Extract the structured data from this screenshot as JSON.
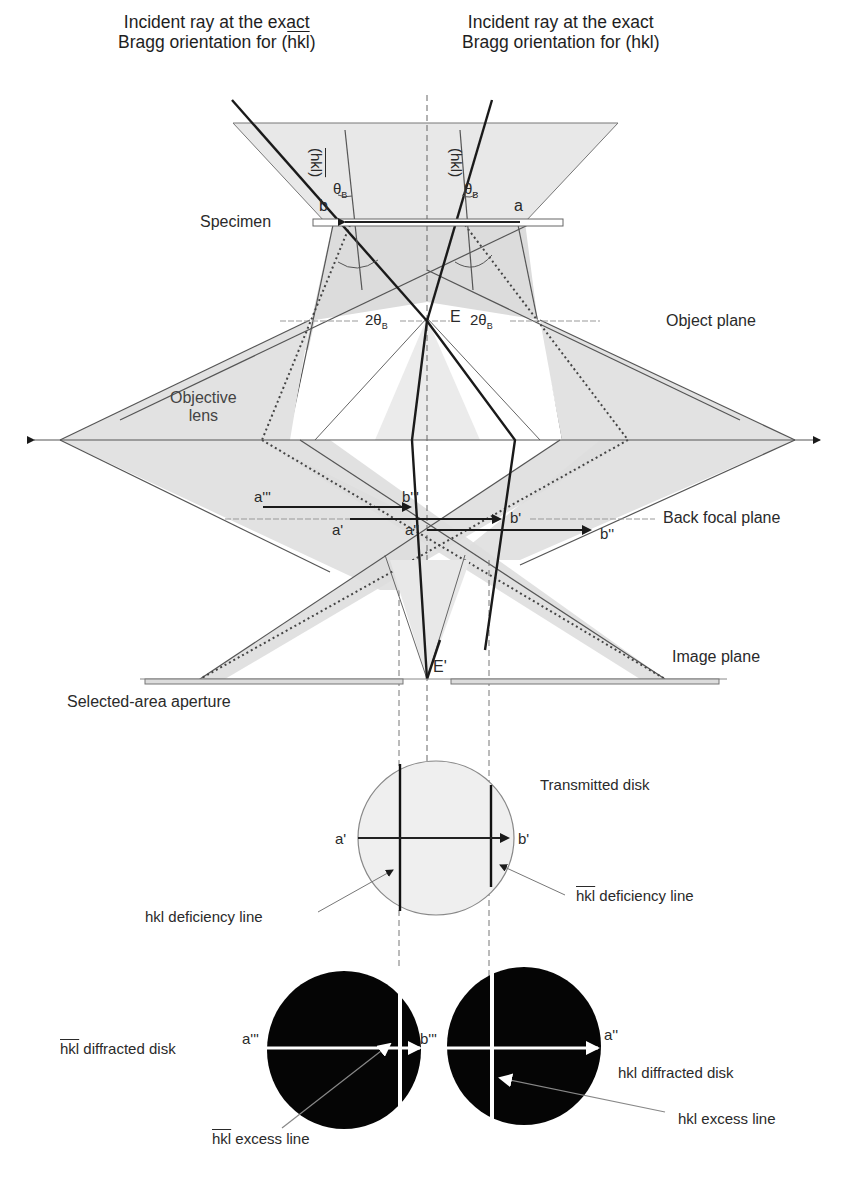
{
  "titles": {
    "left": {
      "line1": "Incident ray at the exact",
      "line2_prefix": "Bragg orientation for (",
      "line2_hkl": "hkl",
      "line2_suffix": ")",
      "hkl_bar": true
    },
    "right": {
      "line1": "Incident ray at the exact",
      "line2": "Bragg orientation for (hkl)"
    }
  },
  "planes": {
    "specimen": "Specimen",
    "object_plane": "Object plane",
    "objective_lens": {
      "line1": "Objective",
      "line2": "lens"
    },
    "back_focal_plane": "Back focal plane",
    "image_plane": "Image plane",
    "selected_area_aperture": "Selected-area aperture"
  },
  "ray_labels": {
    "plane_left": "(hkl)",
    "plane_right": "(hkl)",
    "theta_b": "θ",
    "theta_sub": "B",
    "two_theta_left": "2θ",
    "two_theta_right": "2θ",
    "two_theta_sub": "B",
    "point_a": "a",
    "point_b": "b",
    "point_E": "E",
    "point_E_prime": "E'",
    "a1": "a'",
    "b1": "b'",
    "a2": "a''",
    "b2": "b''",
    "a3": "a'''",
    "b3": "b'''"
  },
  "transmitted_disk": {
    "title": "Transmitted disk",
    "left_point": "a'",
    "right_point": "b'",
    "hkl_deficiency": "hkl deficiency line",
    "hkl_bar_deficiency": "hkl deficiency line"
  },
  "diffracted_disks": {
    "left": {
      "title": "hkl diffracted disk",
      "bar": true,
      "left_point": "a'''",
      "right_point": "b'''",
      "excess": "hkl excess line"
    },
    "right": {
      "title": "hkl diffracted disk",
      "bar": false,
      "right_point": "a''",
      "excess": "hkl excess line"
    }
  },
  "colors": {
    "shade": "#e4e4e4",
    "shade_dark": "#d2d2d2",
    "line": "#555555",
    "heavy": "#1a1a1a",
    "disk_dark": "#050505"
  }
}
